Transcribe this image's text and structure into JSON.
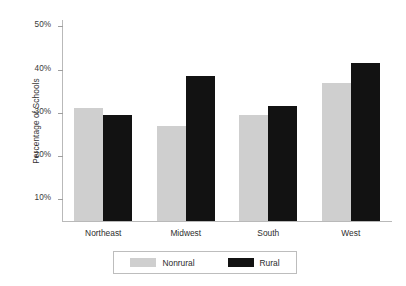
{
  "chart_data": {
    "type": "bar",
    "title": "",
    "subtitle": "",
    "xlabel": "",
    "ylabel": "Percentage of Schools",
    "categories": [
      "Northeast",
      "Midwest",
      "South",
      "West"
    ],
    "series": [
      {
        "name": "Nonrural",
        "color": "#cfcfcf",
        "values": [
          31,
          27,
          29.5,
          37
        ]
      },
      {
        "name": "Rural",
        "color": "#121212",
        "values": [
          29.5,
          38.5,
          31.5,
          41.5
        ]
      }
    ],
    "ylim": [
      4.7,
      51.5
    ],
    "yticks": [
      10,
      20,
      30,
      40,
      50
    ],
    "ytick_labels": [
      "10%",
      "20%",
      "30%",
      "40%",
      "50%"
    ],
    "grid": false,
    "legend_position": "bottom"
  },
  "legend": {
    "entries": [
      {
        "label": "Nonrural",
        "swatch": "legend-swatch-nonrural"
      },
      {
        "label": "Rural",
        "swatch": "legend-swatch-rural"
      }
    ]
  },
  "colors": {
    "nonrural": "#cfcfcf",
    "rural": "#121212",
    "axis": "#b9b9b9",
    "text": "#2b2b2b",
    "background": "#ffffff"
  }
}
